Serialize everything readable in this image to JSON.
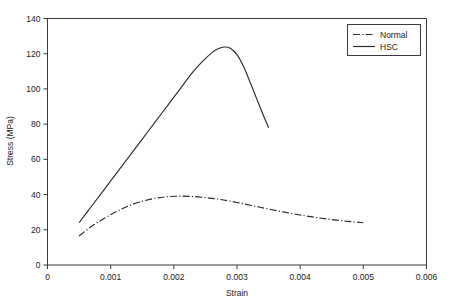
{
  "chart_data": {
    "type": "line",
    "title": "",
    "xlabel": "Strain",
    "ylabel": "Stress (MPa)",
    "xlim": [
      0,
      0.006
    ],
    "ylim": [
      0,
      140
    ],
    "xticks": [
      0,
      0.001,
      0.002,
      0.003,
      0.004,
      0.005,
      0.006
    ],
    "xtick_labels": [
      "0",
      "0.001",
      "0.002",
      "0.003",
      "0.004",
      "0.005",
      "0.006"
    ],
    "yticks": [
      0,
      20,
      40,
      60,
      80,
      100,
      120,
      140
    ],
    "ytick_labels": [
      "0",
      "20",
      "40",
      "60",
      "80",
      "100",
      "120",
      "140"
    ],
    "grid": false,
    "legend_position": "top-right",
    "series": [
      {
        "name": "Normal",
        "linestyle": "dashdot",
        "color": "#2b2b2b",
        "x": [
          0.0005,
          0.0007,
          0.0009,
          0.0011,
          0.0013,
          0.0015,
          0.0017,
          0.0019,
          0.0021,
          0.0023,
          0.0025,
          0.0027,
          0.0029,
          0.0031,
          0.0033,
          0.0035,
          0.00375,
          0.004,
          0.00425,
          0.0045,
          0.00475,
          0.005
        ],
        "y": [
          16.5,
          22.0,
          26.5,
          30.5,
          33.8,
          36.2,
          37.9,
          38.8,
          39.1,
          38.9,
          38.3,
          37.4,
          36.2,
          34.8,
          33.3,
          31.8,
          30.0,
          28.4,
          27.0,
          25.8,
          24.8,
          24.0
        ]
      },
      {
        "name": "HSC",
        "linestyle": "solid",
        "color": "#2b2b2b",
        "x": [
          0.0005,
          0.0007,
          0.0009,
          0.0011,
          0.0013,
          0.0015,
          0.0017,
          0.0019,
          0.0021,
          0.0023,
          0.00245,
          0.0026,
          0.0027,
          0.0028,
          0.0029,
          0.003,
          0.0031,
          0.0032,
          0.0033,
          0.0034,
          0.0035
        ],
        "y": [
          24.0,
          33.5,
          43.0,
          52.5,
          62.0,
          71.5,
          81.0,
          90.5,
          100.0,
          109.5,
          115.5,
          120.5,
          122.8,
          123.8,
          123.0,
          119.5,
          113.0,
          104.5,
          95.5,
          86.5,
          78.0
        ]
      }
    ]
  },
  "legend": {
    "entries": [
      {
        "label": "Normal"
      },
      {
        "label": "HSC"
      }
    ]
  }
}
